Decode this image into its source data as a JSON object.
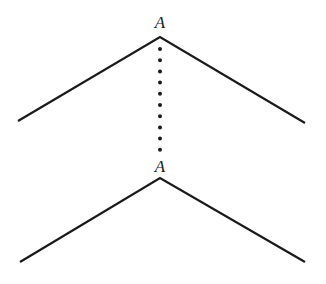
{
  "diagram": {
    "top_vertex_label": "A",
    "bottom_vertex_label": "A",
    "line_color": "#1a1a1a",
    "top_chevron": {
      "left": [
        18,
        121
      ],
      "apex": [
        160,
        37
      ],
      "right": [
        305,
        123
      ]
    },
    "bottom_chevron": {
      "left": [
        20,
        262
      ],
      "apex": [
        160,
        178
      ],
      "right": [
        305,
        262
      ]
    },
    "connector": {
      "style": "dotted",
      "from": [
        160,
        40
      ],
      "to": [
        160,
        160
      ]
    }
  }
}
